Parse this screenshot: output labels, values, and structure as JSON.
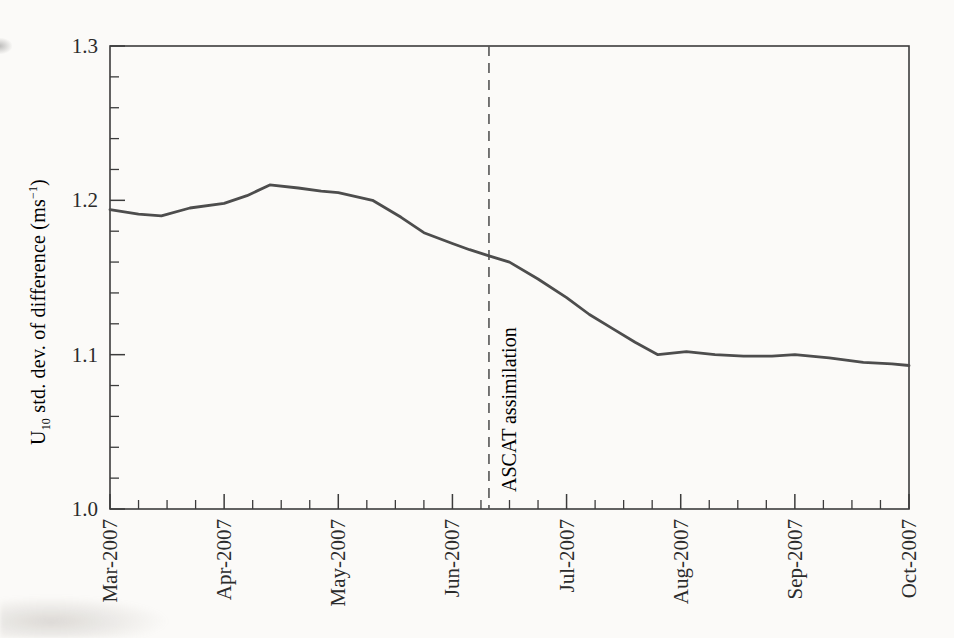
{
  "page": {
    "background": "#fbfaf8",
    "ink_color": "#2b2b2b"
  },
  "chart_data": {
    "type": "line",
    "title": "",
    "xlabel": "",
    "ylabel": {
      "pre": "U",
      "sub": "10",
      "mid": " std. dev. of difference (ms",
      "sup": "−1",
      "post": ")"
    },
    "x_unit": "month index (0 = Mar-2007, 7 = Oct-2007)",
    "x_tick_labels": [
      "Mar-2007",
      "Apr-2007",
      "May-2007",
      "Jun-2007",
      "Jul-2007",
      "Aug-2007",
      "Sep-2007",
      "Oct-2007"
    ],
    "x_minor_ticks_per_interval": 3,
    "xlim": [
      0,
      7
    ],
    "ylim": [
      1.0,
      1.3
    ],
    "y_major_ticks": [
      1.0,
      1.1,
      1.2,
      1.3
    ],
    "y_tick_decimals": 1,
    "y_minor_step": 0.02,
    "grid": false,
    "frame": true,
    "legend": "none",
    "series": [
      {
        "name": "U10 std. dev. of difference",
        "color": "#4d4d4d",
        "x": [
          0.0,
          0.25,
          0.45,
          0.7,
          1.0,
          1.2,
          1.4,
          1.65,
          1.85,
          2.0,
          2.3,
          2.55,
          2.75,
          3.0,
          3.15,
          3.32,
          3.5,
          3.75,
          4.0,
          4.2,
          4.4,
          4.6,
          4.8,
          5.05,
          5.3,
          5.55,
          5.8,
          6.0,
          6.3,
          6.6,
          6.85,
          7.0
        ],
        "y": [
          1.194,
          1.191,
          1.19,
          1.195,
          1.198,
          1.203,
          1.21,
          1.208,
          1.206,
          1.205,
          1.2,
          1.189,
          1.179,
          1.172,
          1.168,
          1.164,
          1.16,
          1.149,
          1.137,
          1.126,
          1.117,
          1.108,
          1.1,
          1.102,
          1.1,
          1.099,
          1.099,
          1.1,
          1.098,
          1.095,
          1.094,
          1.093
        ]
      }
    ],
    "annotation": {
      "label": "ASCAT assimilation",
      "x": 3.32,
      "style": "vertical-dashed-line",
      "color": "#555555"
    },
    "colors": {
      "frame": "#3c3c3c",
      "tick": "#3c3c3c",
      "text": "#2b2b2b"
    }
  }
}
